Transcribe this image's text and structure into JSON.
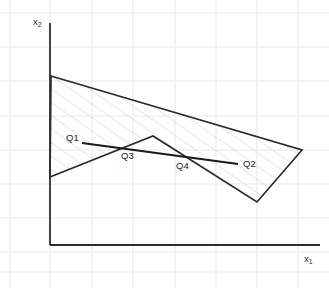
{
  "figure": {
    "title": "",
    "background_color": "#ffffff",
    "grid_color": "#f1f1f3",
    "axis_color": "#2e2e2e",
    "polygon_color": "#2a2a2a",
    "hatch_color": "#c9c9cf",
    "segment_color": "#1a1a1a"
  },
  "axes": {
    "x_label": "x",
    "x_label_sub": "1",
    "y_label": "x",
    "y_label_sub": "2",
    "origin": {
      "x": 50,
      "y": 245
    },
    "x_axis_end": {
      "x": 320,
      "y": 245
    },
    "y_axis_top": {
      "x": 50,
      "y": 23
    }
  },
  "grid": {
    "show": true,
    "vertical_x": [
      10,
      50,
      92,
      133,
      175,
      216,
      257,
      298
    ],
    "horizontal_y": [
      13,
      47,
      81,
      116,
      150,
      184,
      218,
      252,
      272
    ],
    "spacing_x": 41,
    "spacing_y": 34
  },
  "chart_data": {
    "type": "scatter",
    "title": "",
    "xlabel": "x1",
    "ylabel": "x2",
    "grid": true,
    "legend": false,
    "annotations": [
      {
        "label": "Q1",
        "x": 66,
        "y": 139,
        "anchor_point": {
          "x": 82,
          "y": 143
        }
      },
      {
        "label": "Q2",
        "x": 243,
        "y": 165,
        "anchor_point": {
          "x": 238,
          "y": 164
        }
      },
      {
        "label": "Q3",
        "x": 121,
        "y": 157,
        "anchor_point": {
          "x": 118,
          "y": 150
        }
      },
      {
        "label": "Q4",
        "x": 176,
        "y": 167,
        "anchor_point": {
          "x": 186,
          "y": 157
        }
      }
    ],
    "regions": [
      {
        "name": "feasible-region",
        "hatched": true,
        "vertices": [
          {
            "x": 51,
            "y": 76
          },
          {
            "x": 302,
            "y": 150
          },
          {
            "x": 257,
            "y": 202
          },
          {
            "x": 153,
            "y": 136
          },
          {
            "x": 50,
            "y": 177
          }
        ]
      }
    ],
    "segments": [
      {
        "name": "q1-q2-segment",
        "from": {
          "x": 82,
          "y": 143
        },
        "to": {
          "x": 238,
          "y": 164
        }
      }
    ]
  }
}
